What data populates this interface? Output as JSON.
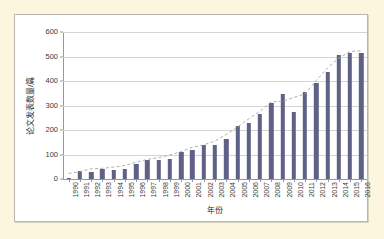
{
  "figure": {
    "background_color": "#fbf6dd",
    "panel_color": "#ffffff",
    "panel_border_color": "#b9b6ad"
  },
  "axis": {
    "x_title": "年份",
    "y_title": "论文发表数量/篇",
    "y_ticks": [
      "0",
      "100",
      "200",
      "300",
      "400",
      "500",
      "600"
    ]
  },
  "chart_data": {
    "type": "bar",
    "title": "",
    "xlabel": "年份",
    "ylabel": "论文发表数量/篇",
    "ylim": [
      0,
      600
    ],
    "ytick_step": 100,
    "grid": true,
    "legend": false,
    "bar_color": "#5f6187",
    "trendline": {
      "present": true,
      "style": "dashed",
      "color": "#a8a59e"
    },
    "categories": [
      "1990",
      "1991",
      "1992",
      "1993",
      "1994",
      "1995",
      "1996",
      "1997",
      "1998",
      "1999",
      "2000",
      "2001",
      "2002",
      "2003",
      "2004",
      "2005",
      "2006",
      "2007",
      "2008",
      "2009",
      "2010",
      "2011",
      "2012",
      "2013",
      "2014",
      "2015",
      "2016"
    ],
    "values": [
      5,
      33,
      27,
      41,
      38,
      42,
      61,
      79,
      76,
      83,
      111,
      117,
      137,
      139,
      165,
      218,
      230,
      266,
      310,
      345,
      272,
      357,
      390,
      437,
      508,
      513,
      516
    ]
  }
}
